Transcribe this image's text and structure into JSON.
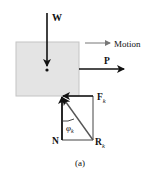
{
  "diagram": {
    "type": "free-body-diagram",
    "caption": "(a)",
    "colors": {
      "block_fill": "#e4e4e4",
      "block_stroke": "#c4c4c4",
      "force": "#111111",
      "motion": "#777777",
      "construction": "#444444"
    },
    "block": {
      "label": "block"
    },
    "forces": {
      "weight": {
        "symbol": "W",
        "direction": "down"
      },
      "push": {
        "symbol": "P",
        "direction": "right"
      },
      "friction": {
        "symbol": "F",
        "subscript": "k",
        "direction": "left"
      },
      "normal": {
        "symbol": "N",
        "direction": "up"
      },
      "resultant": {
        "symbol": "R",
        "subscript": "k",
        "direction": "up-left"
      }
    },
    "motion": {
      "label": "Motion",
      "direction": "right"
    },
    "angle": {
      "symbol": "φ",
      "subscript": "k"
    }
  }
}
